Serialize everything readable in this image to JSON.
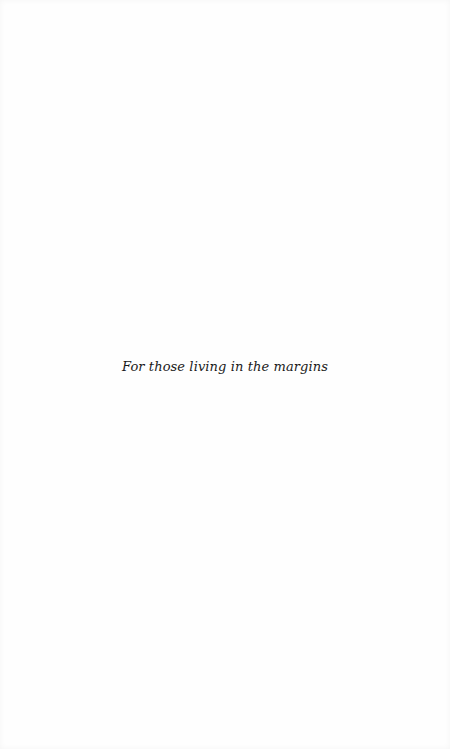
{
  "page": {
    "dedication": "For those living in the margins",
    "background_color": "#fefefe",
    "text_color": "#1a1a1a"
  }
}
